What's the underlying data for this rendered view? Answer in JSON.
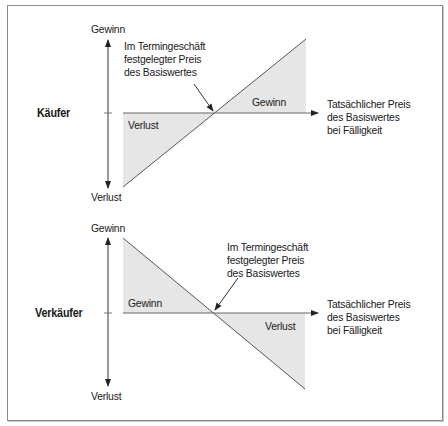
{
  "diagram": {
    "title": "",
    "colors": {
      "frame_border": "#8a8a8a",
      "line": "#555555",
      "axis": "#333333",
      "shading": "#e6e6e6",
      "text": "#1a1a1a"
    },
    "panels": [
      {
        "role_label": "Käufer",
        "y_axis": {
          "top_label": "Gewinn",
          "bottom_label": "Verlust"
        },
        "x_axis_label": [
          "Tatsächlicher Preis",
          "des Basiswertes",
          "bei Fälligkeit"
        ],
        "strike_annotation": [
          "Im Termingeschäft",
          "festgelegter Preis",
          "des Basiswertes"
        ],
        "region_left": "Verlust",
        "region_right": "Gewinn",
        "payoff_direction": "rising"
      },
      {
        "role_label": "Verkäufer",
        "y_axis": {
          "top_label": "Gewinn",
          "bottom_label": "Verlust"
        },
        "x_axis_label": [
          "Tatsächlicher Preis",
          "des Basiswertes",
          "bei Fälligkeit"
        ],
        "strike_annotation": [
          "Im Termingeschäft",
          "festgelegter Preis",
          "des Basiswertes"
        ],
        "region_left": "Gewinn",
        "region_right": "Verlust",
        "payoff_direction": "falling"
      }
    ]
  }
}
